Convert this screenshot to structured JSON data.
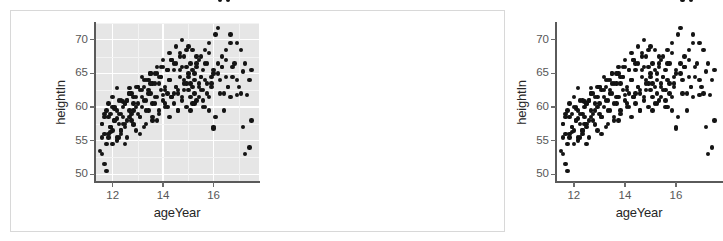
{
  "figure": {
    "title": "",
    "border_color": "#d8d8d8",
    "background": "#ffffff"
  },
  "chart_data": [
    {
      "id": "left",
      "type": "scatter",
      "title": "",
      "xlabel": "ageYear",
      "ylabel": "heightIn",
      "xlim": [
        11.3,
        17.8
      ],
      "ylim": [
        49.0,
        72.5
      ],
      "xticks": [
        12,
        14,
        16
      ],
      "xtick_labels": [
        "12",
        "14",
        "16"
      ],
      "yticks": [
        50,
        55,
        60,
        65,
        70
      ],
      "ytick_labels": [
        "50",
        "55",
        "60",
        "65",
        "70"
      ],
      "grid": true,
      "grid_color": "#ffffff",
      "panel_background": "#e6e6e6",
      "point_color": "#141414",
      "point_size": 4.4,
      "legend": "none",
      "n_points": 236,
      "x": [
        11.92,
        11.92,
        12.08,
        12.17,
        12.25,
        12.25,
        12.33,
        12.42,
        12.5,
        12.5,
        12.58,
        12.67,
        12.75,
        12.83,
        12.92,
        13.0,
        13.08,
        13.17,
        13.25,
        13.33,
        13.42,
        13.5,
        13.58,
        13.67,
        13.75,
        13.83,
        13.92,
        14.0,
        14.08,
        14.17,
        14.25,
        14.33,
        14.42,
        14.5,
        14.58,
        14.67,
        14.75,
        14.83,
        14.92,
        15.0,
        15.08,
        15.17,
        15.25,
        15.33,
        15.42,
        15.5,
        15.58,
        15.67,
        15.75,
        15.83,
        15.92,
        16.0,
        16.08,
        16.17,
        16.25,
        16.33,
        16.42,
        16.5,
        16.58,
        16.67,
        16.75,
        16.83,
        16.92,
        17.0,
        17.08,
        17.17,
        17.25,
        17.33,
        17.42,
        17.5,
        11.58,
        11.58,
        11.67,
        11.67,
        11.75,
        11.75,
        11.83,
        11.83,
        11.92,
        12.0,
        12.0,
        12.08,
        12.08,
        12.17,
        12.17,
        12.25,
        12.33,
        12.33,
        12.42,
        12.42,
        12.5,
        12.58,
        12.58,
        12.67,
        12.67,
        12.75,
        12.83,
        12.83,
        12.92,
        12.92,
        13.0,
        13.08,
        13.08,
        13.17,
        13.25,
        13.25,
        13.33,
        13.42,
        13.42,
        13.5,
        13.58,
        13.58,
        13.67,
        13.75,
        13.75,
        13.83,
        13.92,
        13.92,
        14.0,
        14.08,
        14.08,
        14.17,
        14.25,
        14.25,
        14.33,
        14.42,
        14.42,
        14.5,
        14.58,
        14.58,
        14.67,
        14.75,
        14.75,
        14.83,
        14.92,
        14.92,
        15.0,
        15.08,
        15.08,
        15.17,
        15.25,
        15.25,
        15.33,
        15.42,
        15.42,
        15.5,
        15.58,
        15.58,
        15.67,
        15.75,
        15.83,
        15.92,
        16.0,
        16.08,
        16.17,
        16.25,
        16.33,
        16.42,
        16.5,
        16.58,
        16.67,
        16.75,
        16.92,
        17.08,
        17.25,
        17.42,
        11.5,
        11.58,
        11.67,
        11.75,
        11.83,
        11.92,
        12.0,
        12.08,
        12.17,
        12.25,
        12.33,
        12.42,
        12.5,
        12.58,
        12.67,
        12.75,
        12.83,
        12.92,
        13.0,
        13.08,
        13.17,
        13.25,
        13.33,
        13.42,
        13.5,
        13.58,
        13.67,
        13.75,
        13.83,
        13.92,
        14.0,
        14.08,
        14.17,
        14.25,
        14.33,
        14.42,
        14.5,
        14.58,
        14.67,
        14.75,
        14.83,
        14.92,
        15.0,
        15.08,
        15.17,
        15.25,
        15.33,
        15.42,
        15.5,
        15.58,
        15.67,
        15.75,
        15.83,
        15.92,
        16.0,
        16.17,
        16.33,
        16.5,
        16.67,
        16.92,
        17.17,
        17.5,
        11.58,
        11.67,
        11.83,
        12.0,
        12.17,
        12.33,
        12.5,
        12.67,
        12.83,
        13.0,
        13.17,
        13.33,
        13.5,
        13.67,
        13.83,
        14.0,
        14.17,
        14.33,
        14.5,
        14.67,
        14.83,
        15.0,
        15.17,
        15.33,
        15.5,
        15.67,
        15.83,
        16.0,
        16.25,
        16.58
      ],
      "y": [
        56.3,
        59.0,
        59.8,
        58.3,
        55.5,
        61.0,
        56.5,
        57.5,
        60.5,
        54.5,
        58.0,
        62.8,
        59.0,
        57.3,
        60.0,
        63.0,
        58.5,
        64.5,
        61.0,
        59.5,
        62.0,
        65.0,
        60.5,
        61.5,
        58.0,
        63.5,
        66.0,
        61.8,
        62.5,
        60.0,
        64.0,
        67.0,
        62.0,
        63.0,
        59.5,
        65.5,
        61.5,
        64.0,
        66.0,
        62.5,
        63.5,
        60.5,
        65.0,
        67.5,
        63.0,
        64.5,
        61.0,
        66.5,
        62.0,
        68.0,
        63.5,
        65.0,
        70.8,
        71.8,
        64.0,
        66.0,
        62.0,
        67.0,
        63.0,
        70.8,
        64.5,
        66.5,
        69.5,
        63.0,
        68.5,
        65.3,
        66.5,
        61.8,
        64.0,
        65.5,
        53.0,
        57.5,
        56.0,
        58.5,
        54.5,
        59.5,
        55.5,
        60.5,
        57.0,
        56.5,
        61.5,
        58.0,
        60.0,
        55.0,
        62.8,
        57.5,
        56.0,
        59.0,
        58.5,
        60.8,
        57.0,
        61.0,
        55.5,
        59.5,
        62.0,
        58.0,
        57.5,
        60.5,
        56.5,
        61.5,
        59.0,
        58.5,
        62.5,
        60.0,
        57.0,
        63.0,
        61.0,
        59.5,
        64.0,
        62.0,
        58.0,
        63.5,
        60.5,
        61.5,
        65.0,
        59.0,
        62.5,
        64.5,
        61.0,
        60.0,
        63.0,
        62.0,
        58.5,
        64.0,
        61.5,
        60.5,
        65.5,
        63.0,
        62.0,
        59.5,
        64.5,
        61.0,
        66.0,
        62.5,
        63.5,
        60.0,
        65.0,
        61.5,
        66.5,
        63.0,
        62.0,
        64.0,
        61.0,
        67.0,
        63.5,
        62.5,
        65.5,
        60.0,
        64.0,
        66.5,
        61.5,
        63.0,
        57.0,
        58.5,
        65.0,
        62.0,
        66.0,
        59.5,
        64.5,
        63.0,
        61.5,
        66.0,
        64.0,
        62.0,
        53.0,
        54.0,
        53.5,
        55.5,
        51.5,
        50.5,
        56.0,
        57.0,
        54.5,
        58.0,
        55.5,
        59.0,
        56.5,
        60.0,
        57.5,
        61.0,
        58.5,
        62.0,
        59.5,
        63.0,
        60.5,
        56.0,
        61.5,
        64.0,
        57.5,
        62.5,
        65.0,
        58.5,
        63.5,
        66.0,
        59.5,
        64.5,
        67.0,
        60.5,
        65.5,
        68.0,
        61.5,
        66.5,
        69.0,
        62.5,
        67.5,
        70.0,
        63.5,
        68.5,
        64.5,
        59.5,
        65.5,
        60.5,
        66.5,
        61.5,
        67.5,
        62.5,
        68.5,
        63.5,
        69.5,
        64.5,
        65.5,
        66.5,
        67.5,
        68.5,
        69.5,
        61.8,
        57.0,
        58.0,
        57.5,
        59.0,
        58.5,
        60.0,
        59.5,
        61.0,
        60.5,
        62.0,
        61.5,
        63.0,
        62.5,
        64.0,
        63.5,
        65.0,
        64.5,
        66.0,
        65.5,
        67.0,
        66.5,
        68.0,
        67.5,
        69.0,
        68.5,
        66.0,
        64.5,
        60.0,
        59.5,
        56.8
      ]
    },
    {
      "id": "right",
      "type": "scatter",
      "title": "",
      "xlabel": "ageYear",
      "ylabel": "heightIn",
      "xlim": [
        11.3,
        17.8
      ],
      "ylim": [
        49.0,
        72.5
      ],
      "xticks": [
        12,
        14,
        16
      ],
      "xtick_labels": [
        "12",
        "14",
        "16"
      ],
      "yticks": [
        50,
        55,
        60,
        65,
        70
      ],
      "ytick_labels": [
        "50",
        "55",
        "60",
        "65",
        "70"
      ],
      "grid": false,
      "panel_background": "#ffffff",
      "point_color": "#141414",
      "point_size": 4.4,
      "legend": "none",
      "n_points": 236
    }
  ]
}
